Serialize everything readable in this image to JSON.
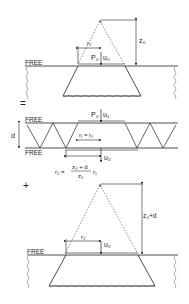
{
  "panel1": {
    "source_label": "s",
    "free_label": "FREE",
    "radius_label": "r₀",
    "load_label": "P₀",
    "displacement_label": "u₀",
    "depth_label": "z₀"
  },
  "operator_equals": "=",
  "panel2": {
    "free_top_label": "FREE",
    "free_bottom_label": "FREE",
    "thickness_label": "d",
    "load_label": "P₀",
    "displacement_top_label": "u₁",
    "radius_label": "r₁ = r₀",
    "displacement_bottom_label": "u₂",
    "formula_lhs": "r₂ =",
    "formula_numerator": "z₀ + d",
    "formula_denominator": "z₀",
    "formula_factor": "r₁"
  },
  "operator_plus": "+",
  "panel3": {
    "source_label": "s",
    "free_label": "FREE",
    "radius_label": "r₂",
    "displacement_label": "u₂",
    "depth_label": "z₀+d"
  },
  "colors": {
    "line": "#222222",
    "background": "#ffffff"
  }
}
